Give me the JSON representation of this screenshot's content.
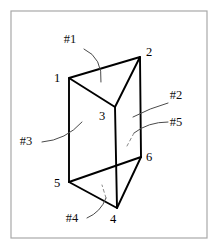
{
  "figure": {
    "background_color": "#ffffff",
    "frame_color": "#a8a8a8",
    "line_color": "#000000",
    "leader_color": "#4a4a4a",
    "vertices": [
      {
        "id": "v1",
        "label": "1",
        "x": 69,
        "y": 78,
        "label_x": 57,
        "label_y": 82
      },
      {
        "id": "v2",
        "label": "2",
        "x": 140,
        "y": 57,
        "label_x": 146,
        "label_y": 56
      },
      {
        "id": "v3",
        "label": "3",
        "x": 115,
        "y": 107,
        "label_x": 102,
        "label_y": 120
      },
      {
        "id": "v4",
        "label": "4",
        "x": 117,
        "y": 208,
        "label_x": 113,
        "label_y": 223
      },
      {
        "id": "v5",
        "label": "5",
        "x": 69,
        "y": 182,
        "label_x": 57,
        "label_y": 187
      },
      {
        "id": "v6",
        "label": "6",
        "x": 141,
        "y": 157,
        "label_x": 146,
        "label_y": 161
      }
    ],
    "callouts": [
      {
        "id": "c1",
        "label": "#1",
        "label_x": 70,
        "label_y": 43,
        "target": "top-face-1-2-3"
      },
      {
        "id": "c2",
        "label": "#2",
        "label_x": 176,
        "label_y": 99,
        "target": "right-face-3-2-6-4"
      },
      {
        "id": "c3",
        "label": "#3",
        "label_x": 26,
        "label_y": 145,
        "target": "left-face-1-3-4-5"
      },
      {
        "id": "c4",
        "label": "#4",
        "label_x": 72,
        "label_y": 222,
        "target": "bottom-face-5-4-6"
      },
      {
        "id": "c5",
        "label": "#5",
        "label_x": 176,
        "label_y": 126,
        "target": "hidden-back-face"
      }
    ]
  }
}
